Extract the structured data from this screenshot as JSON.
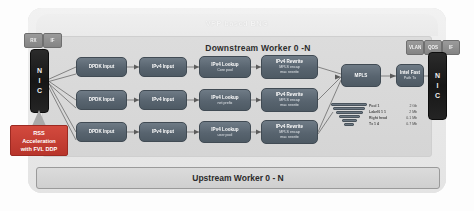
{
  "diagram": {
    "title": "VPP based BNG",
    "downstream_title": "Downstream Worker 0 -N",
    "upstream_title": "Upstream Worker 0 - N"
  },
  "nic": {
    "left_label": [
      "N",
      "I",
      "C"
    ],
    "right_label": [
      "N",
      "I",
      "C"
    ]
  },
  "tabs": {
    "left": [
      {
        "label": "RX"
      },
      {
        "label": "IF"
      }
    ],
    "right": [
      {
        "label": "VLAN"
      },
      {
        "label": "QOS"
      },
      {
        "label": "IF"
      }
    ]
  },
  "rss": {
    "line1": "RSS",
    "line2": "Acceleration",
    "line3": "with FVL DDP"
  },
  "pipeline": {
    "rows": [
      [
        {
          "l1": "DPDK Input",
          "l2": "",
          "l3": ""
        },
        {
          "l1": "IPv4 Input",
          "l2": "",
          "l3": ""
        },
        {
          "l1": "IPv4 Lookup",
          "l2": "Core pool",
          "l3": ""
        },
        {
          "l1": "IPv4 Rewrite",
          "l2": "MPLS encap",
          "l3": "mac rewrite"
        }
      ],
      [
        {
          "l1": "DPDK Input",
          "l2": "",
          "l3": ""
        },
        {
          "l1": "IPv4 Input",
          "l2": "",
          "l3": ""
        },
        {
          "l1": "IPv4 Lookup",
          "l2": "net prefix",
          "l3": ""
        },
        {
          "l1": "IPv4 Rewrite",
          "l2": "MPLS encap",
          "l3": "mac rewrite"
        }
      ],
      [
        {
          "l1": "DPDK Input",
          "l2": "",
          "l3": ""
        },
        {
          "l1": "IPv4 Input",
          "l2": "",
          "l3": ""
        },
        {
          "l1": "IPv4 Lookup",
          "l2": "user pool",
          "l3": ""
        },
        {
          "l1": "IPv4 Rewrite",
          "l2": "MPLS encap",
          "l3": "mac rewrite"
        }
      ]
    ],
    "mpls": {
      "l1": "MPLS",
      "l2": "",
      "l3": ""
    },
    "output": {
      "l1": "Intel Fast",
      "l2": "Path Tx",
      "l3": ""
    }
  },
  "stats": {
    "rows": [
      {
        "key": "Pool 1",
        "value": "2 Gb"
      },
      {
        "key": "Label0 1 1",
        "value": "2 Mb"
      },
      {
        "key": "Right head",
        "value": "0.1 Mb"
      },
      {
        "key": "Tx 1 4",
        "value": "0.7 Mb"
      }
    ]
  }
}
